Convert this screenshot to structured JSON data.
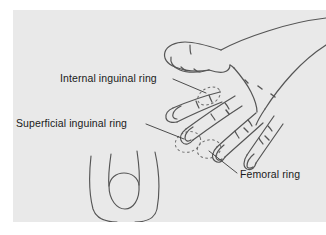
{
  "figure": {
    "background_color": "#e9e9e9",
    "page_color": "#ffffff",
    "line_color": "#4a4a4a",
    "text_color": "#1a1a1a"
  },
  "labels": [
    {
      "id": "internal-inguinal-ring",
      "text": "Internal inguinal ring",
      "x": 47,
      "y": 72,
      "anchor": "start",
      "leader": "M 160,69 L 192,82"
    },
    {
      "id": "superficial-inguinal-ring",
      "text": "Superficial inguinal ring",
      "x": 3,
      "y": 117,
      "anchor": "start",
      "leader": "M 133,114 L 172,129"
    },
    {
      "id": "femoral-ring",
      "text": "Femoral ring",
      "x": 227,
      "y": 168,
      "anchor": "start",
      "leader": "M 224,163 L 196,141"
    }
  ],
  "structures": {
    "hand": "left hand, dorsal view, fingers directed down and to the left",
    "thumb": "thumb extended to the left at top of figure",
    "fingers": [
      "index finger",
      "middle finger",
      "ring finger",
      "little finger"
    ],
    "groin_outline": "U-shaped scrotal / groin contour with circular testis outline at lower left"
  },
  "markers": [
    {
      "id": "internal-ring-marker",
      "type": "dashed-ellipse",
      "cx": 196,
      "cy": 85,
      "rx": 11,
      "ry": 8,
      "rotate": -28
    },
    {
      "id": "superficial-ring-marker",
      "type": "dashed-ellipse",
      "cx": 176,
      "cy": 133,
      "rx": 12,
      "ry": 10,
      "rotate": -20
    },
    {
      "id": "femoral-ring-marker",
      "type": "dashed-ellipse",
      "cx": 196,
      "cy": 139,
      "rx": 11,
      "ry": 9,
      "rotate": -15
    }
  ]
}
